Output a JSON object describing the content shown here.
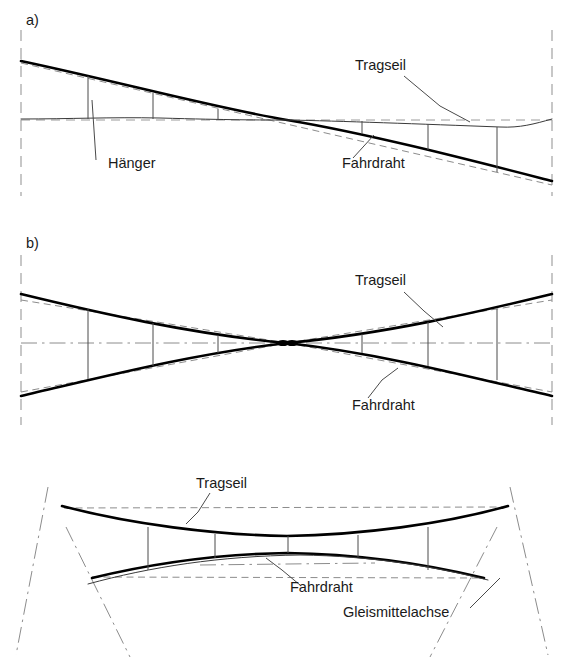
{
  "figure": {
    "background_color": "#ffffff",
    "ink_color": "#000000",
    "dash_color": "#8c8c8c",
    "width": 574,
    "height": 657
  },
  "panels": [
    {
      "id": "a",
      "id_label": "a)",
      "description": "Elevation of overlap: contact wire descends across the span while the catenary stays near horizontal",
      "labels": [
        {
          "name": "tragseil",
          "text": "Tragseil",
          "x": 355,
          "y": 70
        },
        {
          "name": "hanger",
          "text": "Hänger",
          "x": 108,
          "y": 168
        },
        {
          "name": "fahrdraht",
          "text": "Fahrdraht",
          "x": 342,
          "y": 168
        }
      ],
      "hanger_positions": [
        88,
        153,
        218,
        362,
        428,
        497
      ]
    },
    {
      "id": "b",
      "id_label": "b)",
      "description": "Elevation of crossing: catenary and contact wire cross at mid span forming an X",
      "labels": [
        {
          "name": "tragseil",
          "text": "Tragseil",
          "x": 355,
          "y": 285
        },
        {
          "name": "fahrdraht",
          "text": "Fahrdraht",
          "x": 352,
          "y": 410
        }
      ],
      "hanger_positions": [
        88,
        153,
        218,
        362,
        428,
        497
      ]
    },
    {
      "id": "c",
      "id_label": "",
      "description": "Plan view of crossing with track centre lines",
      "labels": [
        {
          "name": "tragseil",
          "text": "Tragseil",
          "x": 196,
          "y": 488
        },
        {
          "name": "fahrdraht",
          "text": "Fahrdraht",
          "x": 290,
          "y": 592
        },
        {
          "name": "gleismittelachse",
          "text": "Gleismittelachse",
          "x": 343,
          "y": 617
        }
      ],
      "hanger_positions": [
        148,
        215,
        288,
        358,
        428
      ]
    }
  ],
  "legend_terms": [
    {
      "key": "tragseil",
      "text": "Tragseil"
    },
    {
      "key": "fahrdraht",
      "text": "Fahrdraht"
    },
    {
      "key": "haenger",
      "text": "Hänger"
    },
    {
      "key": "gleismittelachse",
      "text": "Gleismittelachse"
    }
  ]
}
